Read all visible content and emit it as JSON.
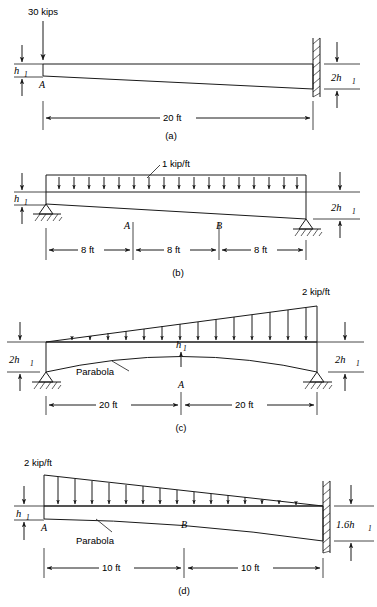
{
  "figure": {
    "panels": [
      {
        "id": "a",
        "caption": "(a)",
        "load_label": "30 kips",
        "load_type": "point-load",
        "left_depth_label": "h",
        "left_depth_sub": "1",
        "right_depth_label": "2h",
        "right_depth_sub": "1",
        "point_labels": [
          "A"
        ],
        "support_left": "free-end",
        "support_right": "fixed-wall",
        "dimensions": [
          {
            "label": "20 ft"
          }
        ]
      },
      {
        "id": "b",
        "caption": "(b)",
        "load_label": "1 kip/ft",
        "load_type": "uniform-distributed",
        "left_depth_label": "h",
        "left_depth_sub": "1",
        "right_depth_label": "2h",
        "right_depth_sub": "1",
        "point_labels": [
          "A",
          "B"
        ],
        "support_left": "pin",
        "support_right": "pin",
        "dimensions": [
          {
            "label": "8 ft"
          },
          {
            "label": "8 ft"
          },
          {
            "label": "8 ft"
          }
        ]
      },
      {
        "id": "c",
        "caption": "(c)",
        "load_label": "2 kip/ft",
        "load_type": "triangular-distributed",
        "left_depth_label": "2h",
        "left_depth_sub": "1",
        "right_depth_label": "2h",
        "right_depth_sub": "1",
        "mid_depth_label": "h",
        "mid_depth_sub": "1",
        "curve_label": "Parabola",
        "point_labels": [
          "A"
        ],
        "support_left": "pin",
        "support_right": "pin",
        "dimensions": [
          {
            "label": "20 ft"
          },
          {
            "label": "20 ft"
          }
        ]
      },
      {
        "id": "d",
        "caption": "(d)",
        "load_label": "2 kip/ft",
        "load_type": "triangular-distributed",
        "left_depth_label": "h",
        "left_depth_sub": "1",
        "right_depth_label": "1.6h",
        "right_depth_sub": "1",
        "curve_label": "Parabola",
        "point_labels": [
          "A",
          "B"
        ],
        "support_left": "free-end",
        "support_right": "fixed-wall",
        "dimensions": [
          {
            "label": "10 ft"
          },
          {
            "label": "10 ft"
          }
        ]
      }
    ],
    "colors": {
      "ink": "#1a1a1a",
      "background": "#ffffff"
    }
  }
}
